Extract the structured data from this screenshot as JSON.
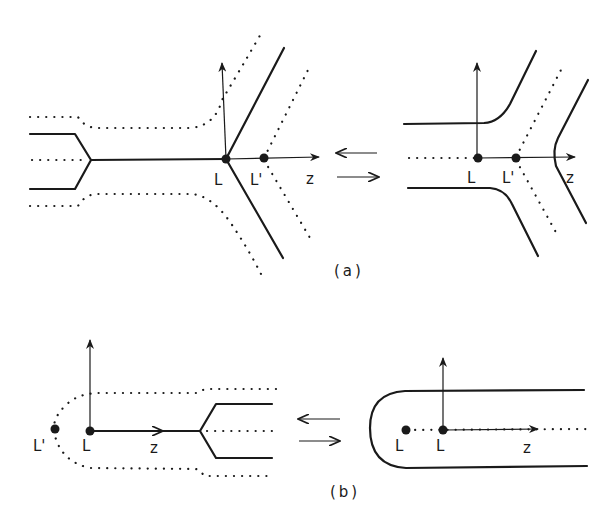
{
  "figure": {
    "panel_a": {
      "caption": "(a)",
      "left": {
        "points": [
          {
            "label": "L"
          },
          {
            "label": "L'"
          }
        ],
        "axis_label": "z"
      },
      "right": {
        "points": [
          {
            "label": "L"
          },
          {
            "label": "L'"
          }
        ],
        "axis_label": "z"
      },
      "exchange_arrows": [
        "left-arrow",
        "right-arrow"
      ]
    },
    "panel_b": {
      "caption": "(b)",
      "left": {
        "points": [
          {
            "label": "L'"
          },
          {
            "label": "L"
          }
        ],
        "axis_label": "z"
      },
      "right": {
        "points": [
          {
            "label": "L"
          },
          {
            "label": "L"
          }
        ],
        "axis_label": "z"
      },
      "exchange_arrows": [
        "left-arrow",
        "right-arrow"
      ]
    },
    "colors": {
      "ink": "#1a1a1a",
      "background": "#ffffff"
    }
  }
}
